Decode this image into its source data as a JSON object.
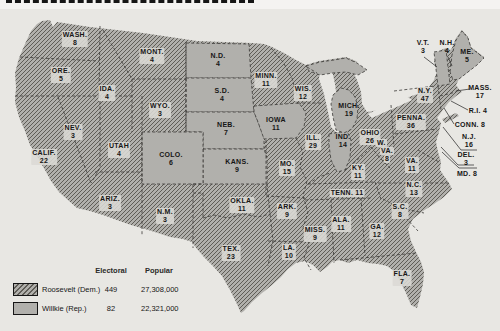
{
  "colors": {
    "background": "#e8e7e3",
    "land_gray": "#b1b0ac",
    "hatch_line": "#5f5d57",
    "state_border": "#3a3936",
    "label_box": "#dbdad5",
    "text": "#161616"
  },
  "legend": {
    "col_electoral": "Electoral",
    "col_popular": "Popular",
    "rows": [
      {
        "party": "Roosevelt (Dem.)",
        "electoral": "449",
        "popular": "27,308,000",
        "swatch": "hatched"
      },
      {
        "party": "Willkie (Rep.)",
        "electoral": "82",
        "popular": "22,321,000",
        "swatch": "solid"
      }
    ]
  },
  "map": {
    "hatched_means": "Roosevelt (Dem.)",
    "solid_means": "Willkie (Rep.)",
    "states": [
      {
        "id": "wash",
        "label": "WASH.",
        "votes": "8",
        "party": "dem",
        "x": 75,
        "y": 31,
        "boxed": true
      },
      {
        "id": "ore",
        "label": "ORE.",
        "votes": "5",
        "party": "dem",
        "x": 61,
        "y": 67,
        "boxed": true
      },
      {
        "id": "calif",
        "label": "CALIF.",
        "votes": "22",
        "party": "dem",
        "x": 44,
        "y": 149,
        "boxed": true
      },
      {
        "id": "nev",
        "label": "NEV.",
        "votes": "3",
        "party": "dem",
        "x": 73,
        "y": 124,
        "boxed": true
      },
      {
        "id": "ida",
        "label": "IDA.",
        "votes": "4",
        "party": "dem",
        "x": 107,
        "y": 85,
        "boxed": true
      },
      {
        "id": "mont",
        "label": "MONT.",
        "votes": "4",
        "party": "dem",
        "x": 152,
        "y": 48,
        "boxed": true
      },
      {
        "id": "wyo",
        "label": "WYO.",
        "votes": "3",
        "party": "dem",
        "x": 160,
        "y": 102,
        "boxed": true
      },
      {
        "id": "utah",
        "label": "UTAH",
        "votes": "4",
        "party": "dem",
        "x": 119,
        "y": 142,
        "boxed": true
      },
      {
        "id": "ariz",
        "label": "ARIZ.",
        "votes": "3",
        "party": "dem",
        "x": 110,
        "y": 195,
        "boxed": true
      },
      {
        "id": "nm",
        "label": "N.M.",
        "votes": "3",
        "party": "dem",
        "x": 165,
        "y": 208,
        "boxed": true
      },
      {
        "id": "nd",
        "label": "N.D.",
        "votes": "4",
        "party": "rep",
        "x": 218,
        "y": 52,
        "boxed": false
      },
      {
        "id": "sd",
        "label": "S.D.",
        "votes": "4",
        "party": "rep",
        "x": 222,
        "y": 87,
        "boxed": false
      },
      {
        "id": "neb",
        "label": "NEB.",
        "votes": "7",
        "party": "rep",
        "x": 226,
        "y": 121,
        "boxed": false
      },
      {
        "id": "kans",
        "label": "KANS.",
        "votes": "9",
        "party": "rep",
        "x": 237,
        "y": 158,
        "boxed": false
      },
      {
        "id": "colo",
        "label": "COLO.",
        "votes": "6",
        "party": "rep",
        "x": 171,
        "y": 151,
        "boxed": false
      },
      {
        "id": "okla",
        "label": "OKLA.",
        "votes": "11",
        "party": "dem",
        "x": 242,
        "y": 197,
        "boxed": true
      },
      {
        "id": "tex",
        "label": "TEX.",
        "votes": "23",
        "party": "dem",
        "x": 231,
        "y": 245,
        "boxed": true
      },
      {
        "id": "minn",
        "label": "MINN.",
        "votes": "11",
        "party": "dem",
        "x": 266,
        "y": 72,
        "boxed": true
      },
      {
        "id": "iowa",
        "label": "IOWA",
        "votes": "11",
        "party": "rep",
        "x": 276,
        "y": 116,
        "boxed": false
      },
      {
        "id": "mo",
        "label": "MO.",
        "votes": "15",
        "party": "dem",
        "x": 287,
        "y": 160,
        "boxed": true
      },
      {
        "id": "ark",
        "label": "ARK.",
        "votes": "9",
        "party": "dem",
        "x": 287,
        "y": 203,
        "boxed": true
      },
      {
        "id": "la",
        "label": "LA.",
        "votes": "10",
        "party": "dem",
        "x": 289,
        "y": 244,
        "boxed": true
      },
      {
        "id": "wis",
        "label": "WIS.",
        "votes": "12",
        "party": "dem",
        "x": 303,
        "y": 85,
        "boxed": true
      },
      {
        "id": "ill",
        "label": "ILL.",
        "votes": "29",
        "party": "dem",
        "x": 313,
        "y": 134,
        "boxed": true
      },
      {
        "id": "miss",
        "label": "MISS.",
        "votes": "9",
        "party": "dem",
        "x": 315,
        "y": 226,
        "boxed": true
      },
      {
        "id": "mich",
        "label": "MICH.",
        "votes": "19",
        "party": "rep",
        "x": 349,
        "y": 102,
        "boxed": false
      },
      {
        "id": "ind",
        "label": "IND.",
        "votes": "14",
        "party": "rep",
        "x": 343,
        "y": 133,
        "boxed": false
      },
      {
        "id": "ohio",
        "label": "OHIO",
        "votes": "26",
        "party": "dem",
        "x": 370,
        "y": 129,
        "boxed": true
      },
      {
        "id": "ky",
        "label": "KY.",
        "votes": "11",
        "party": "dem",
        "x": 358,
        "y": 164,
        "boxed": true
      },
      {
        "id": "tenn",
        "label": "TENN.",
        "votes": "11",
        "party": "dem",
        "x": 347,
        "y": 189,
        "boxed": true,
        "single": true
      },
      {
        "id": "ala",
        "label": "ALA.",
        "votes": "11",
        "party": "dem",
        "x": 341,
        "y": 216,
        "boxed": true
      },
      {
        "id": "ga",
        "label": "GA.",
        "votes": "12",
        "party": "dem",
        "x": 377,
        "y": 223,
        "boxed": true
      },
      {
        "id": "fla",
        "label": "FLA.",
        "votes": "7",
        "party": "dem",
        "x": 402,
        "y": 270,
        "boxed": true
      },
      {
        "id": "sc",
        "label": "S.C.",
        "votes": "8",
        "party": "dem",
        "x": 400,
        "y": 203,
        "boxed": true
      },
      {
        "id": "nc",
        "label": "N.C.",
        "votes": "13",
        "party": "dem",
        "x": 414,
        "y": 181,
        "boxed": true
      },
      {
        "id": "va",
        "label": "VA.",
        "votes": "11",
        "party": "dem",
        "x": 412,
        "y": 157,
        "boxed": true
      },
      {
        "id": "wva",
        "label": "W.",
        "votes": "8",
        "party": "dem",
        "x": 376,
        "y": 139,
        "boxed": true,
        "slant_lines": [
          "W.",
          "VA.",
          "8"
        ]
      },
      {
        "id": "penna",
        "label": "PENNA.",
        "votes": "36",
        "party": "dem",
        "x": 411,
        "y": 114,
        "boxed": true
      },
      {
        "id": "ny",
        "label": "N.Y.",
        "votes": "47",
        "party": "dem",
        "x": 425,
        "y": 87,
        "boxed": true
      },
      {
        "id": "vt",
        "label": "V.T.",
        "votes": "3",
        "party": "rep",
        "x": 423,
        "y": 39,
        "boxed": false
      },
      {
        "id": "nh",
        "label": "N.H.",
        "votes": "4",
        "party": "dem",
        "x": 447,
        "y": 39,
        "boxed": false
      },
      {
        "id": "me",
        "label": "ME.",
        "votes": "5",
        "party": "rep",
        "x": 467,
        "y": 48,
        "boxed": false
      },
      {
        "id": "mass",
        "label": "MASS.",
        "votes": "17",
        "party": "dem",
        "x": 480,
        "y": 84,
        "boxed": false
      },
      {
        "id": "ri",
        "label": "R.I.",
        "votes": "4",
        "party": "dem",
        "x": 478,
        "y": 107,
        "boxed": false,
        "single": true
      },
      {
        "id": "conn",
        "label": "CONN.",
        "votes": "8",
        "party": "dem",
        "x": 470,
        "y": 121,
        "boxed": false,
        "single": true
      },
      {
        "id": "nj",
        "label": "N.J.",
        "votes": "16",
        "party": "dem",
        "x": 469,
        "y": 133,
        "boxed": false
      },
      {
        "id": "del",
        "label": "DEL.",
        "votes": "3",
        "party": "dem",
        "x": 466,
        "y": 151,
        "boxed": false
      },
      {
        "id": "md",
        "label": "MD.",
        "votes": "8",
        "party": "dem",
        "x": 467,
        "y": 170,
        "boxed": false,
        "single": true
      }
    ]
  }
}
